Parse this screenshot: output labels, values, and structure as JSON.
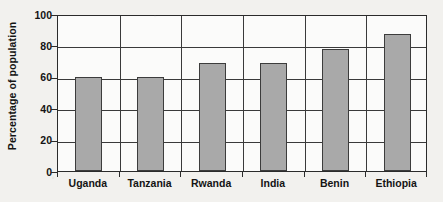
{
  "chart_data": {
    "type": "bar",
    "title": "",
    "subtitle": "",
    "xlabel": "",
    "ylabel": "Percentage of population",
    "categories": [
      "Uganda",
      "Tanzania",
      "Rwanda",
      "India",
      "Benin",
      "Ethiopia"
    ],
    "values": [
      60,
      60,
      69,
      69,
      78,
      87
    ],
    "ylim": [
      0,
      100
    ],
    "ytick_labels": [
      "0",
      "20",
      "40",
      "60",
      "80",
      "100"
    ],
    "ytick_values": [
      0,
      20,
      40,
      60,
      80,
      100
    ],
    "grid": "horizontal-and-vertical",
    "legend": "none",
    "bar_color": "#a9a9a9",
    "bar_edge_color": "#3c3c3c",
    "axis_color": "#2b2b2b",
    "grid_color": "#3a3a3a",
    "plot_background": "#fbfbfa",
    "page_background": "#f2f1ee"
  }
}
